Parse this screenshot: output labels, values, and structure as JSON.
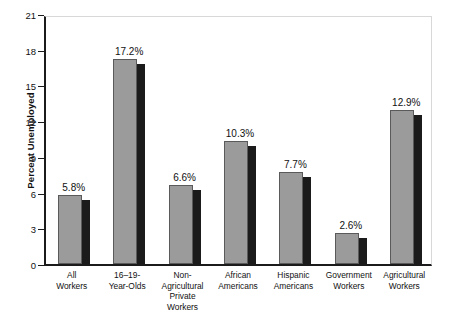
{
  "chart_data": {
    "type": "bar",
    "title": "",
    "xlabel": "",
    "ylabel": "Percent Unemployed",
    "ylim": [
      0,
      21
    ],
    "ytick_labels": [
      "0",
      "3",
      "6",
      "9",
      "12",
      "15",
      "18",
      "21"
    ],
    "ytick_values": [
      0,
      3,
      6,
      9,
      12,
      15,
      18,
      21
    ],
    "grid": false,
    "legend": "none",
    "categories": [
      "All\nWorkers",
      "16–19-\nYear-Olds",
      "Non-\nAgricultural\nPrivate\nWorkers",
      "African\nAmericans",
      "Hispanic\nAmericans",
      "Government\nWorkers",
      "Agricultural\nWorkers"
    ],
    "values": [
      5.8,
      17.2,
      6.6,
      10.3,
      7.7,
      2.6,
      12.9
    ],
    "value_labels": [
      "5.8%",
      "17.2%",
      "6.6%",
      "10.3%",
      "7.7%",
      "2.6%",
      "12.9%"
    ],
    "colors": {
      "bar_front": "#9b9b9b",
      "bar_side": "#1b1b1b",
      "axis": "#1b1b1b",
      "frame_light": "#d8d8d8",
      "background": "#ffffff",
      "text": "#111111"
    }
  }
}
